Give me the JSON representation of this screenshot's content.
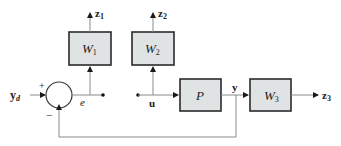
{
  "diagram": {
    "type": "control-system-block-diagram",
    "blocks": [
      {
        "id": "W1",
        "label": "W",
        "sub": "1"
      },
      {
        "id": "W2",
        "label": "W",
        "sub": "2"
      },
      {
        "id": "P",
        "label": "P"
      },
      {
        "id": "W3",
        "label": "W",
        "sub": "3"
      }
    ],
    "signals": {
      "yd": {
        "label": "y",
        "sub": "d"
      },
      "e": {
        "label": "e"
      },
      "u": {
        "label": "u"
      },
      "y": {
        "label": "y"
      },
      "z1": {
        "label": "z",
        "sub": "1"
      },
      "z2": {
        "label": "z",
        "sub": "2"
      },
      "z3": {
        "label": "z",
        "sub": "3"
      }
    },
    "summing_junction": {
      "plus": "+",
      "minus": "−"
    },
    "colors": {
      "block_fill": "#dfe3e3",
      "block_stroke": "#2a2a2a",
      "wire": "#8a8a8a"
    }
  }
}
